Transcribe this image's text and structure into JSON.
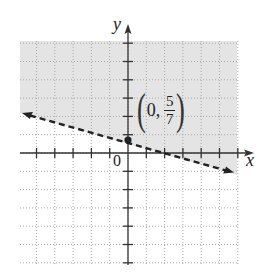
{
  "chart_data": {
    "type": "line",
    "title": "",
    "xlabel": "x",
    "ylabel": "y",
    "xlim": [
      -6,
      6
    ],
    "ylim": [
      -6,
      6
    ],
    "grid": true,
    "grid_style": "dotted",
    "boundary_line": {
      "style": "dashed",
      "equation": "y = -2/7 x + 5/7",
      "slope": -0.2857,
      "y_intercept": 0.7143,
      "points": [
        [
          -5.7,
          2.34
        ],
        [
          0,
          0.7143
        ],
        [
          2.5,
          0
        ],
        [
          5.7,
          -0.91
        ]
      ],
      "arrows_both_ends": true
    },
    "shaded_region": "above the line (y > -2/7 x + 5/7)",
    "shade_color": "#e6e6e6",
    "marked_point": {
      "x": 0,
      "y": 0.7143,
      "label": "(0, 5/7)"
    },
    "origin_label": "0"
  },
  "labels": {
    "x_axis": "x",
    "y_axis": "y",
    "origin": "0",
    "point_x": "0,",
    "point_num": "5",
    "point_den": "7",
    "paren_open": "(",
    "paren_close": ")"
  }
}
